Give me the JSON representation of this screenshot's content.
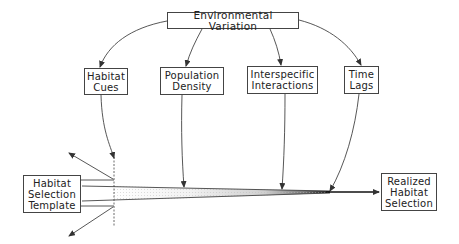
{
  "diagram": {
    "source": {
      "label": "Environmental Variation"
    },
    "factors": [
      {
        "id": "habitat-cues",
        "lines": [
          "Habitat",
          "Cues"
        ]
      },
      {
        "id": "population-density",
        "lines": [
          "Population",
          "Density"
        ]
      },
      {
        "id": "interspecific-interactions",
        "lines": [
          "Interspecific",
          "Interactions"
        ]
      },
      {
        "id": "time-lags",
        "lines": [
          "Time",
          "Lags"
        ]
      }
    ],
    "start": {
      "lines": [
        "Habitat",
        "Selection",
        "Template"
      ]
    },
    "end": {
      "lines": [
        "Realized",
        "Habitat",
        "Selection"
      ]
    },
    "colors": {
      "line": "#444444",
      "box_border": "#444444",
      "text": "#222222",
      "funnel_dark": "#111111"
    }
  }
}
